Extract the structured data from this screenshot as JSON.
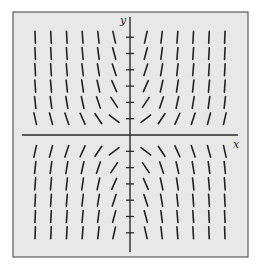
{
  "figure": {
    "type": "slope-field",
    "equation_slope": "x*y",
    "x_axis_label": "x",
    "y_axis_label": "y",
    "colors": {
      "background": "#ffffff",
      "panel": "#e8e8e8",
      "frame": "#5a5a5a",
      "axis": "#2a2a2a",
      "segment": "#222222"
    },
    "frame": {
      "left": 13,
      "top": 12,
      "right": 248,
      "bottom": 257
    },
    "origin_px": {
      "x": 130,
      "y": 135
    },
    "axis_extent": {
      "x_from": 22,
      "x_to": 238,
      "y_from": 17,
      "y_to": 252
    },
    "grid_step_px": {
      "x": 15.8,
      "y": 16.3
    },
    "x_values": [
      -6,
      -5,
      -4,
      -3,
      -2,
      -1,
      1,
      2,
      3,
      4,
      5,
      6
    ],
    "y_values": [
      -6,
      -5,
      -4,
      -3,
      -2,
      -1,
      1,
      2,
      3,
      4,
      5,
      6
    ],
    "y_ticks": [
      -6,
      -5,
      -4,
      -3,
      -2,
      -1,
      1,
      2,
      3,
      4,
      5,
      6
    ],
    "segment_length_px": 12,
    "slope_scale": 0.75
  }
}
